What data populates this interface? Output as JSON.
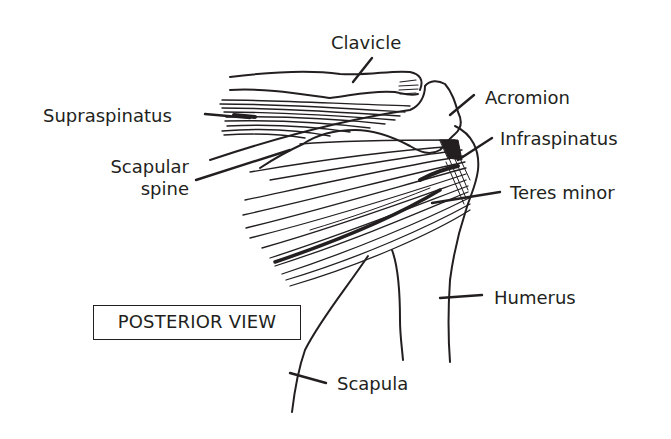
{
  "diagram": {
    "view_label": "POSTERIOR VIEW",
    "ink_color": "#231f20",
    "background_color": "#ffffff",
    "labels": {
      "clavicle": "Clavicle",
      "supraspinatus": "Supraspinatus",
      "acromion": "Acromion",
      "infraspinatus": "Infraspinatus",
      "scapular_spine_line1": "Scapular",
      "scapular_spine_line2": "spine",
      "teres_minor": "Teres minor",
      "humerus": "Humerus",
      "scapula": "Scapula"
    }
  }
}
